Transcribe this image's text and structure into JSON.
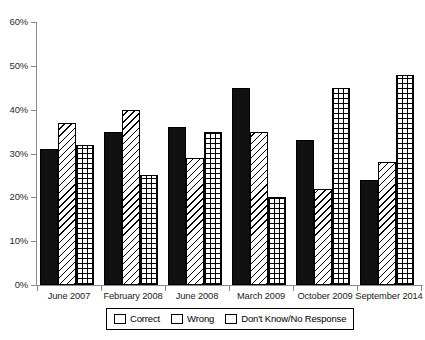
{
  "chart_data": {
    "type": "bar",
    "title": "",
    "subtitle": "",
    "xlabel": "",
    "ylabel": "",
    "ylim": [
      0,
      60
    ],
    "ytick_values": [
      0,
      10,
      20,
      30,
      40,
      50,
      60
    ],
    "ytick_labels": [
      "0%",
      "10%",
      "20%",
      "30%",
      "40%",
      "50%",
      "60%"
    ],
    "grid": false,
    "legend_position": "bottom",
    "categories": [
      "June 2007",
      "February 2008",
      "June 2008",
      "March 2009",
      "October 2009",
      "September 2014"
    ],
    "series": [
      {
        "name": "Correct",
        "pattern": "solid-black",
        "values": [
          31,
          35,
          36,
          45,
          33,
          24
        ]
      },
      {
        "name": "Wrong",
        "pattern": "diagonal-hatch",
        "values": [
          37,
          40,
          29,
          35,
          22,
          28
        ]
      },
      {
        "name": "Don't Know/No Response",
        "pattern": "crosshatch-grid",
        "values": [
          32,
          25,
          35,
          20,
          45,
          48
        ]
      }
    ]
  },
  "colors": {
    "axis": "#8a8a8a",
    "bar_outline": "#000000",
    "correct_fill": "#111111",
    "background": "#ffffff",
    "text": "#000000"
  },
  "legend": {
    "items": [
      {
        "label": "Correct",
        "icon": "solid-swatch-icon"
      },
      {
        "label": "Wrong",
        "icon": "diagonal-hatch-swatch-icon"
      },
      {
        "label": "Don't Know/No Response",
        "icon": "crosshatch-swatch-icon"
      }
    ]
  }
}
